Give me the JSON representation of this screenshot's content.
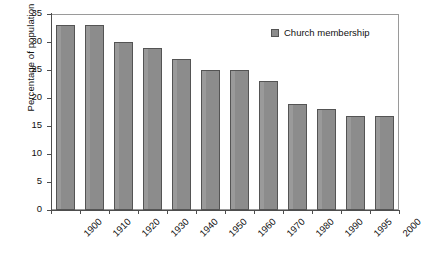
{
  "chart_data": {
    "type": "bar",
    "title": "",
    "xlabel": "",
    "ylabel": "Percentage of population",
    "categories": [
      "1900",
      "1910",
      "1920",
      "1930",
      "1940",
      "1950",
      "1960",
      "1970",
      "1980",
      "1990",
      "1995",
      "2000"
    ],
    "values": [
      33,
      33,
      30,
      29,
      27,
      25,
      25,
      23,
      19,
      18,
      16.7,
      16.7
    ],
    "series": [
      {
        "name": "Church membership",
        "values": [
          33,
          33,
          30,
          29,
          27,
          25,
          25,
          23,
          19,
          18,
          16.7,
          16.7
        ]
      }
    ],
    "ylim": [
      0,
      35
    ],
    "ytick_step": 5,
    "yticks": [
      "0",
      "5",
      "10",
      "15",
      "20",
      "25",
      "30",
      "35"
    ],
    "grid": false,
    "legend": {
      "position": "top-right",
      "entries": [
        "Church membership"
      ]
    },
    "colors": {
      "bar_fill": "#8c8c8c",
      "bar_edge": "#545454",
      "axis": "#4d4d4d",
      "frame": "#9a9a9a",
      "text": "#111111",
      "background": "#ffffff"
    }
  }
}
